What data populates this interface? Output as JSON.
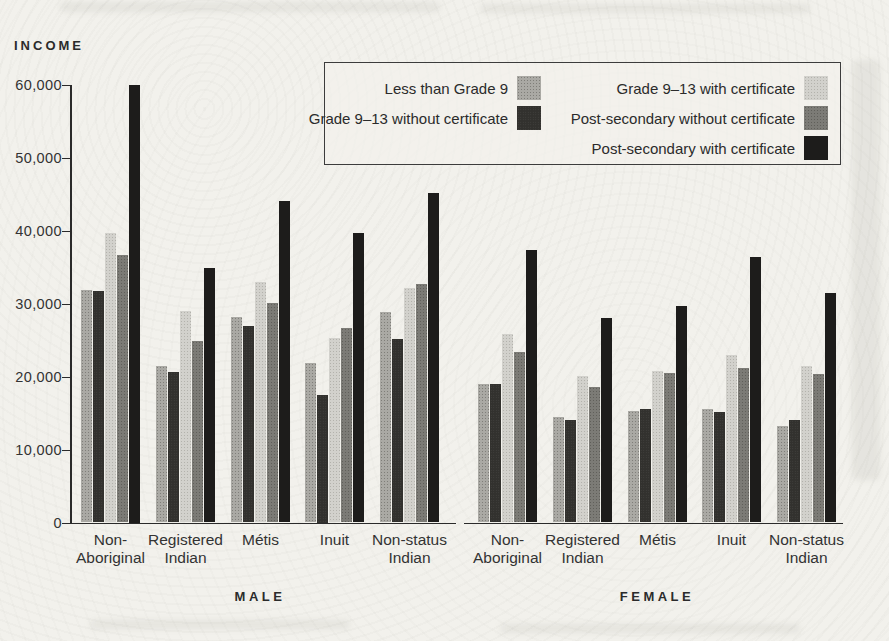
{
  "page": {
    "kind": "scanned book page with bar chart",
    "background_color": "#f2f1ec"
  },
  "chart_data": {
    "type": "bar",
    "title": "",
    "ylabel": "INCOME",
    "xlabel": "",
    "ylim": [
      0,
      60000
    ],
    "grid": false,
    "legend_position": "boxed, top right, two columns",
    "yticks": [
      0,
      10000,
      20000,
      30000,
      40000,
      50000,
      60000
    ],
    "ytick_labels": [
      "0",
      "10,000",
      "20,000",
      "30,000",
      "40,000",
      "50,000",
      "60,000"
    ],
    "legend": [
      {
        "label": "Less than Grade 9",
        "color": "#aaa9a4"
      },
      {
        "label": "Grade 9–13 without certificate",
        "color": "#32312e"
      },
      {
        "label": "Grade 9–13 with certificate",
        "color": "#d2d1cc"
      },
      {
        "label": "Post-secondary without certificate",
        "color": "#7c7b76"
      },
      {
        "label": "Post-secondary with certificate",
        "color": "#1d1c1b"
      }
    ],
    "legend_columns": [
      [
        0,
        1
      ],
      [
        2,
        3,
        4
      ]
    ],
    "series_order": [
      "Less than Grade 9",
      "Grade 9–13 without certificate",
      "Grade 9–13 with certificate",
      "Post-secondary without certificate",
      "Post-secondary with certificate"
    ],
    "sections": [
      {
        "label": "MALE",
        "groups": [
          {
            "label_lines": [
              "Non-",
              "Aboriginal"
            ],
            "values": [
              31800,
              31700,
              39600,
              36700,
              60000
            ]
          },
          {
            "label_lines": [
              "Registered",
              "Indian"
            ],
            "values": [
              21400,
              20600,
              29000,
              24800,
              34800
            ]
          },
          {
            "label_lines": [
              "Métis"
            ],
            "values": [
              28200,
              26900,
              32900,
              30100,
              44000
            ]
          },
          {
            "label_lines": [
              "Inuit"
            ],
            "values": [
              21900,
              17500,
              25300,
              26700,
              39700
            ]
          },
          {
            "label_lines": [
              "Non-status",
              "Indian"
            ],
            "values": [
              28800,
              25200,
              32100,
              32700,
              45100
            ]
          }
        ]
      },
      {
        "label": "FEMALE",
        "groups": [
          {
            "label_lines": [
              "Non-",
              "Aboriginal"
            ],
            "values": [
              19000,
              19000,
              25800,
              23300,
              37300
            ]
          },
          {
            "label_lines": [
              "Registered",
              "Indian"
            ],
            "values": [
              14400,
              14000,
              20100,
              18600,
              28000
            ]
          },
          {
            "label_lines": [
              "Métis"
            ],
            "values": [
              15300,
              15500,
              20800,
              20500,
              29700
            ]
          },
          {
            "label_lines": [
              "Inuit"
            ],
            "values": [
              15600,
              15100,
              22900,
              21200,
              36400
            ]
          },
          {
            "label_lines": [
              "Non-status",
              "Indian"
            ],
            "values": [
              13200,
              14000,
              21400,
              20400,
              31500
            ]
          }
        ]
      }
    ]
  }
}
